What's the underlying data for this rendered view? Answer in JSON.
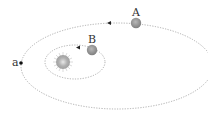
{
  "diagram": {
    "star": {
      "name": "sun",
      "cx": 63,
      "cy": 62,
      "r": 7
    },
    "orbits": [
      {
        "name": "outer-orbit",
        "cx": 117,
        "cy": 66,
        "rx": 96,
        "ry": 43
      },
      {
        "name": "inner-orbit",
        "cx": 75,
        "cy": 62,
        "rx": 30,
        "ry": 17
      }
    ],
    "planets": [
      {
        "label": "A",
        "cx": 136,
        "cy": 23,
        "r": 5
      },
      {
        "label": "B",
        "cx": 92,
        "cy": 50,
        "r": 5
      }
    ],
    "point": {
      "label": "a",
      "cx": 21,
      "cy": 63
    },
    "arrows": [
      {
        "name": "outer-direction-arrow",
        "x": 109,
        "y": 23
      },
      {
        "name": "inner-direction-arrow",
        "x": 78,
        "y": 47
      }
    ],
    "colors": {
      "orbit": "#9a9a9a",
      "planet": "#8a8a8a",
      "star": "#b5b5b5",
      "point": "#111111"
    }
  }
}
